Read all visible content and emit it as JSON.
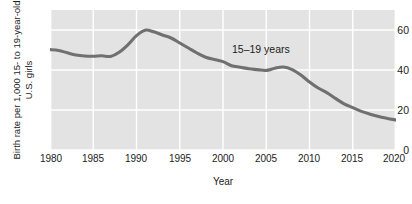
{
  "chart_data": {
    "type": "line",
    "title": "",
    "xlabel": "Year",
    "ylabel_line1": "Birth rate per 1,000 15- to 19-year-old",
    "ylabel_line2": "U.S. girls",
    "xlim": [
      1980,
      2020
    ],
    "ylim": [
      0,
      70
    ],
    "xticks": [
      1980,
      1985,
      1990,
      1995,
      2000,
      2005,
      2010,
      2015,
      2020
    ],
    "xtick_labels": [
      "1980",
      "1985",
      "1990",
      "1995",
      "2000",
      "2005",
      "2010",
      "2015",
      "2020"
    ],
    "yticks": [
      0,
      20,
      40,
      60
    ],
    "ytick_labels": [
      "0",
      "20",
      "40",
      "60"
    ],
    "grid": true,
    "legend_position": "inline-annotation",
    "annotations": [
      {
        "text": "15–19 years",
        "x": 2000,
        "y": 49
      }
    ],
    "series": [
      {
        "name": "15–19 years",
        "color": "#707070",
        "x": [
          1980,
          1981,
          1982,
          1983,
          1984,
          1985,
          1986,
          1987,
          1988,
          1989,
          1990,
          1991,
          1992,
          1993,
          1994,
          1995,
          1996,
          1997,
          1998,
          1999,
          2000,
          2001,
          2002,
          2003,
          2004,
          2005,
          2006,
          2007,
          2008,
          2009,
          2010,
          2011,
          2012,
          2013,
          2014,
          2015,
          2016,
          2017,
          2018,
          2019,
          2020
        ],
        "values": [
          50.2,
          49.8,
          48.6,
          47.5,
          47.0,
          46.9,
          47.1,
          46.8,
          48.9,
          52.6,
          57.2,
          59.9,
          59.1,
          57.5,
          56.0,
          53.5,
          51.0,
          48.5,
          46.4,
          45.2,
          44.2,
          42.1,
          41.4,
          40.6,
          40.2,
          39.8,
          40.9,
          41.5,
          40.2,
          37.5,
          34.0,
          31.0,
          28.7,
          25.8,
          23.1,
          21.2,
          19.3,
          17.9,
          16.7,
          15.8,
          15.0
        ]
      }
    ]
  },
  "axis": {
    "ytick_values": [
      "60",
      "40",
      "20",
      "0"
    ],
    "xtick_values": [
      "1980",
      "1985",
      "1990",
      "1995",
      "2000",
      "2005",
      "2010",
      "2015",
      "2020"
    ],
    "xaxis_title": "Year",
    "ylabel_line1": "Birth rate per 1,000 15- to 19-year-old",
    "ylabel_line2": "U.S. girls"
  },
  "annotation": {
    "series_label": "15–19 years"
  },
  "colors": {
    "plot_background": "#e3e3e3",
    "gridline": "#ffffff",
    "line": "#707070",
    "text": "#1c1c1c",
    "page_background": "#ffffff"
  }
}
